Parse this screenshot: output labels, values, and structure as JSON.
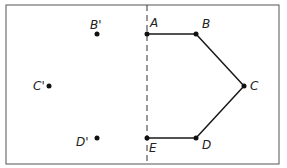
{
  "diagram": {
    "type": "reflection",
    "mirror_line": {
      "style": "dashed",
      "x": 147
    },
    "polygon": {
      "points": [
        {
          "label": "A",
          "x": 147,
          "y": 34
        },
        {
          "label": "B",
          "x": 196,
          "y": 34
        },
        {
          "label": "C",
          "x": 244,
          "y": 86
        },
        {
          "label": "D",
          "x": 196,
          "y": 138
        },
        {
          "label": "E",
          "x": 147,
          "y": 138
        }
      ]
    },
    "reflected_points": [
      {
        "label": "B'",
        "x": 97,
        "y": 34
      },
      {
        "label": "C'",
        "x": 49,
        "y": 86
      },
      {
        "label": "D'",
        "x": 97,
        "y": 138
      }
    ],
    "colors": {
      "ink": "#1a1a1a",
      "border": "#444444",
      "background": "#ffffff"
    }
  }
}
